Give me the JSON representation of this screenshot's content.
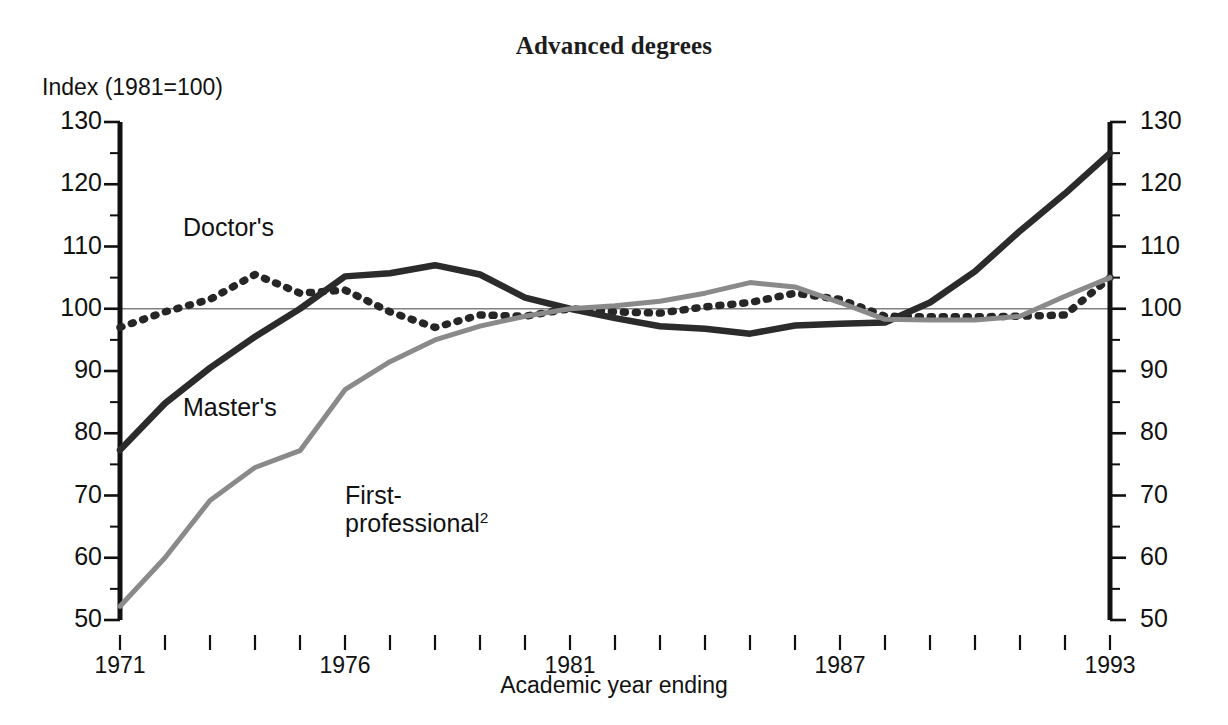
{
  "chart_data": {
    "type": "line",
    "title": "Advanced degrees",
    "ylabel": "Index (1981=100)",
    "xlabel": "Academic year ending",
    "ylim": [
      50,
      130
    ],
    "xlim": [
      1971,
      1993
    ],
    "ytick_labels": [
      "130",
      "120",
      "110",
      "100",
      "90",
      "80",
      "70",
      "60",
      "50"
    ],
    "ytick_values": [
      130,
      120,
      110,
      100,
      90,
      80,
      70,
      60,
      50
    ],
    "minor_tick_step": 5,
    "xtick_labels": [
      "1971",
      "1976",
      "1981",
      "1987",
      "1993"
    ],
    "xtick_values": [
      1971,
      1976,
      1981,
      1987,
      1993
    ],
    "reference_line": 100,
    "grid": false,
    "legend_position": "inline-labels",
    "x": [
      1971,
      1972,
      1973,
      1974,
      1975,
      1976,
      1977,
      1978,
      1979,
      1980,
      1981,
      1982,
      1983,
      1984,
      1985,
      1986,
      1987,
      1988,
      1989,
      1990,
      1991,
      1992,
      1993
    ],
    "series": [
      {
        "name": "Doctor's",
        "style": "dotted",
        "color": "#262626",
        "label_x": 1972.4,
        "label_y": 112.5,
        "values": [
          97,
          99.5,
          101.5,
          105.5,
          102.5,
          103,
          99.5,
          97,
          99,
          98.8,
          100,
          99.5,
          99.3,
          100.3,
          101,
          102.5,
          101.5,
          98.8,
          98.7,
          98.7,
          98.8,
          99,
          105
        ]
      },
      {
        "name": "Master's",
        "style": "solid-thick",
        "color": "#2b2b2b",
        "label_x": 1972.4,
        "label_y": 83.5,
        "values": [
          77.3,
          84.8,
          90.5,
          95.5,
          100,
          105.2,
          105.7,
          107,
          105.5,
          101.8,
          100,
          98.5,
          97.2,
          96.8,
          96,
          97.3,
          97.6,
          97.8,
          101,
          106,
          112.5,
          118.5,
          125
        ]
      },
      {
        "name": "First-professional2",
        "style": "solid-medium",
        "color": "#8a8a8a",
        "label_x": 1976.0,
        "label_y": 69.5,
        "values": [
          52.2,
          60,
          69.2,
          74.5,
          77.2,
          87,
          91.5,
          95,
          97.2,
          98.8,
          100,
          100.5,
          101.2,
          102.5,
          104.2,
          103.5,
          101,
          98.3,
          98.2,
          98.2,
          98.8,
          102,
          105
        ]
      }
    ]
  },
  "series_labels": {
    "doctors": "Doctor's",
    "masters": "Master's",
    "first_professional_line1": "First-",
    "first_professional_line2": "professional",
    "first_professional_footnote": "2"
  }
}
